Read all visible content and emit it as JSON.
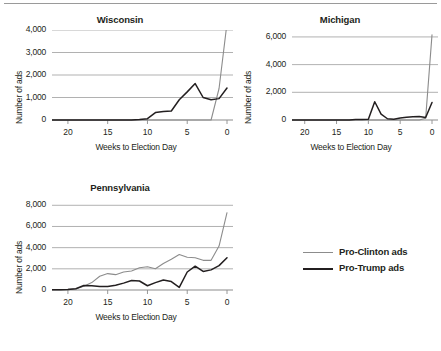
{
  "figure": {
    "background": "#ffffff",
    "rule_color": "#9a9a9a"
  },
  "legend": {
    "position": "right-middle",
    "entries": [
      {
        "label": "Pro-Clinton ads",
        "color": "#8c8c8c"
      },
      {
        "label": "Pro-Trump ads",
        "color": "#231f20"
      }
    ]
  },
  "chart_data": [
    {
      "type": "line",
      "title": "Wisconsin",
      "xlabel": "Weeks to Election Day",
      "ylabel": "Number of ads",
      "xlim": [
        22,
        0
      ],
      "ylim": [
        0,
        4000
      ],
      "xticks": [
        20,
        15,
        10,
        5,
        0
      ],
      "yticks": [
        0,
        1000,
        2000,
        3000,
        4000
      ],
      "ytick_labels": [
        "0",
        "1,000",
        "2,000",
        "3,000",
        "4,000"
      ],
      "xtick_labels": [
        "20",
        "15",
        "10",
        "5",
        "0"
      ],
      "grid": "horizontal",
      "x": [
        22,
        21,
        20,
        19,
        18,
        17,
        16,
        15,
        14,
        13,
        12,
        11,
        10,
        9,
        8,
        7,
        6,
        5,
        4,
        3,
        2,
        1,
        0
      ],
      "series": [
        {
          "name": "Pro-Clinton ads",
          "color": "#8c8c8c",
          "values": [
            0,
            0,
            0,
            0,
            0,
            0,
            0,
            0,
            0,
            0,
            0,
            0,
            0,
            0,
            0,
            0,
            0,
            0,
            0,
            0,
            0,
            1400,
            4300
          ]
        },
        {
          "name": "Pro-Trump ads",
          "color": "#231f20",
          "values": [
            0,
            0,
            0,
            0,
            0,
            0,
            0,
            0,
            0,
            0,
            0,
            20,
            60,
            330,
            380,
            400,
            900,
            1250,
            1620,
            1000,
            900,
            950,
            1420
          ]
        }
      ]
    },
    {
      "type": "line",
      "title": "Michigan",
      "xlabel": "Weeks to Election Day",
      "ylabel": "Number of ads",
      "xlim": [
        22,
        0
      ],
      "ylim": [
        0,
        6500
      ],
      "xticks": [
        20,
        15,
        10,
        5,
        0
      ],
      "yticks": [
        0,
        2000,
        4000,
        6000
      ],
      "ytick_labels": [
        "0",
        "2,000",
        "4,000",
        "6,000"
      ],
      "xtick_labels": [
        "20",
        "15",
        "10",
        "5",
        "0"
      ],
      "grid": "horizontal",
      "x": [
        22,
        21,
        20,
        19,
        18,
        17,
        16,
        15,
        14,
        13,
        12,
        11,
        10,
        9,
        8,
        7,
        6,
        5,
        4,
        3,
        2,
        1,
        0
      ],
      "series": [
        {
          "name": "Pro-Clinton ads",
          "color": "#8c8c8c",
          "values": [
            0,
            0,
            0,
            0,
            0,
            0,
            0,
            0,
            0,
            0,
            0,
            0,
            0,
            0,
            0,
            0,
            0,
            0,
            0,
            0,
            0,
            120,
            6150
          ]
        },
        {
          "name": "Pro-Trump ads",
          "color": "#231f20",
          "values": [
            0,
            0,
            0,
            0,
            0,
            0,
            0,
            0,
            0,
            0,
            30,
            30,
            60,
            1320,
            420,
            90,
            60,
            140,
            200,
            230,
            260,
            180,
            1260
          ]
        }
      ]
    },
    {
      "type": "line",
      "title": "Pennsylvania",
      "xlabel": "Weeks to Election Day",
      "ylabel": "Number of ads",
      "xlim": [
        22,
        0
      ],
      "ylim": [
        0,
        8500
      ],
      "xticks": [
        20,
        15,
        10,
        5,
        0
      ],
      "yticks": [
        0,
        2000,
        4000,
        6000,
        8000
      ],
      "ytick_labels": [
        "0",
        "2,000",
        "4,000",
        "6,000",
        "8,000"
      ],
      "xtick_labels": [
        "20",
        "15",
        "10",
        "5",
        "0"
      ],
      "grid": "horizontal",
      "x": [
        22,
        21,
        20,
        19,
        18,
        17,
        16,
        15,
        14,
        13,
        12,
        11,
        10,
        9,
        8,
        7,
        6,
        5,
        4,
        3,
        2,
        1,
        0
      ],
      "series": [
        {
          "name": "Pro-Clinton ads",
          "color": "#8c8c8c",
          "values": [
            20,
            40,
            60,
            120,
            360,
            700,
            1300,
            1550,
            1450,
            1700,
            1800,
            2100,
            2200,
            2000,
            2500,
            2900,
            3350,
            3100,
            3050,
            2800,
            2800,
            4150,
            7300
          ]
        },
        {
          "name": "Pro-Trump ads",
          "color": "#231f20",
          "values": [
            20,
            30,
            50,
            120,
            420,
            400,
            330,
            330,
            450,
            650,
            900,
            850,
            400,
            700,
            950,
            800,
            250,
            1700,
            2250,
            1750,
            1900,
            2300,
            3050
          ]
        }
      ]
    }
  ]
}
